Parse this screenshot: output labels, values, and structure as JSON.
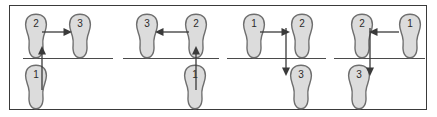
{
  "figure": {
    "background_color": "#ffffff",
    "frame_color": "#3a3a3a",
    "line_color": "#4a4a4a",
    "foot_fill": "#dcdcdc",
    "foot_stroke": "#6e6e6e",
    "arrow_color": "#3a3a3a"
  },
  "panels": [
    {
      "id": "panel-1",
      "feet": [
        {
          "label": "1",
          "row": "bottom",
          "x": 18,
          "y": 60
        },
        {
          "label": "2",
          "row": "top",
          "x": 22,
          "y": 10
        },
        {
          "label": "3",
          "row": "top",
          "x": 66,
          "y": 10
        }
      ],
      "arrows": [
        {
          "id": "arrow-1-to-2",
          "direction": "up",
          "from": "1",
          "to": "2"
        },
        {
          "id": "arrow-2-to-3",
          "direction": "right",
          "from": "2",
          "to": "3"
        }
      ]
    },
    {
      "id": "panel-2",
      "feet": [
        {
          "label": "1",
          "row": "bottom",
          "x": 181,
          "y": 60
        },
        {
          "label": "2",
          "row": "top",
          "x": 182,
          "y": 10
        },
        {
          "label": "3",
          "row": "top",
          "x": 133,
          "y": 10
        }
      ],
      "arrows": [
        {
          "id": "arrow-1-to-2",
          "direction": "up",
          "from": "1",
          "to": "2"
        },
        {
          "id": "arrow-2-to-3",
          "direction": "left",
          "from": "2",
          "to": "3"
        }
      ]
    },
    {
      "id": "panel-3",
      "feet": [
        {
          "label": "1",
          "row": "top",
          "x": 240,
          "y": 10
        },
        {
          "label": "2",
          "row": "top",
          "x": 288,
          "y": 10
        },
        {
          "label": "3",
          "row": "bottom",
          "x": 287,
          "y": 60
        }
      ],
      "arrows": [
        {
          "id": "arrow-1-to-2",
          "direction": "right",
          "from": "1",
          "to": "2"
        },
        {
          "id": "arrow-2-to-3",
          "direction": "down",
          "from": "2",
          "to": "3"
        }
      ]
    },
    {
      "id": "panel-4",
      "feet": [
        {
          "label": "1",
          "row": "top",
          "x": 396,
          "y": 10
        },
        {
          "label": "2",
          "row": "top",
          "x": 348,
          "y": 10
        },
        {
          "label": "3",
          "row": "bottom",
          "x": 345,
          "y": 60
        }
      ],
      "arrows": [
        {
          "id": "arrow-1-to-2",
          "direction": "left",
          "from": "1",
          "to": "2"
        },
        {
          "id": "arrow-2-to-3",
          "direction": "down",
          "from": "2",
          "to": "3"
        }
      ]
    }
  ],
  "divider_lines": [
    {
      "id": "divider-1",
      "x": 22,
      "width": 90
    },
    {
      "id": "divider-2",
      "x": 122,
      "width": 96
    },
    {
      "id": "divider-3",
      "x": 226,
      "width": 99
    },
    {
      "id": "divider-4",
      "x": 333,
      "width": 91
    }
  ]
}
